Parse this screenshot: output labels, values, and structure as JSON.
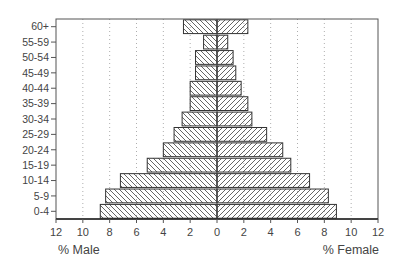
{
  "chart_data": {
    "type": "bar",
    "subtype": "population-pyramid",
    "title": "",
    "categories": [
      "60+",
      "55-59",
      "50-54",
      "45-49",
      "40-44",
      "35-39",
      "30-34",
      "25-29",
      "20-24",
      "15-19",
      "10-14",
      "5-9",
      "0-4"
    ],
    "series": [
      {
        "name": "% Male",
        "side": "left",
        "hatch": "backslash",
        "values": [
          2.5,
          1.0,
          1.6,
          1.6,
          2.0,
          2.0,
          2.6,
          3.2,
          4.0,
          5.2,
          7.2,
          8.3,
          8.7
        ]
      },
      {
        "name": "% Female",
        "side": "right",
        "hatch": "slash",
        "values": [
          2.3,
          0.8,
          1.2,
          1.4,
          1.8,
          2.3,
          2.6,
          3.7,
          4.9,
          5.5,
          6.9,
          8.3,
          8.9
        ]
      }
    ],
    "xlabel_left": "% Male",
    "xlabel_right": "% Female",
    "ylabel": "",
    "xlim": [
      -12,
      12
    ],
    "x_ticks_left": [
      "12",
      "10",
      "8",
      "6",
      "4",
      "2"
    ],
    "x_ticks_center": "0",
    "x_ticks_right": [
      "2",
      "4",
      "6",
      "8",
      "10",
      "12"
    ],
    "tick_values": [
      -12,
      -10,
      -8,
      -6,
      -4,
      -2,
      0,
      2,
      4,
      6,
      8,
      10,
      12
    ],
    "tick_labels": [
      "12",
      "10",
      "8",
      "6",
      "4",
      "2",
      "0",
      "2",
      "4",
      "6",
      "8",
      "10",
      "12"
    ],
    "grid": {
      "vertical": true,
      "style": "dotted",
      "at": [
        -10,
        -8,
        -6,
        -4,
        -2,
        2,
        4,
        6,
        8,
        10
      ]
    },
    "legend": null,
    "colors": {
      "bar_stroke": "#333333",
      "hatch": "#555555",
      "frame": "#555555",
      "grid": "#999999",
      "text": "#444444"
    }
  }
}
